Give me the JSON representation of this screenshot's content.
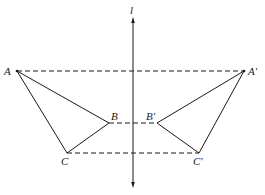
{
  "diagram": {
    "axis_label": "l",
    "points": [
      {
        "id": "A",
        "label": "A"
      },
      {
        "id": "B",
        "label": "B"
      },
      {
        "id": "C",
        "label": "C"
      },
      {
        "id": "A1",
        "label": "A′"
      },
      {
        "id": "B1",
        "label": "B′"
      },
      {
        "id": "C1",
        "label": "C′"
      }
    ],
    "triangles": [
      {
        "name": "original",
        "vertices": [
          "A",
          "B",
          "C"
        ]
      },
      {
        "name": "image",
        "vertices": [
          "A1",
          "B1",
          "C1"
        ]
      }
    ],
    "correspondence_segments": [
      {
        "from": "A",
        "to": "A1",
        "style": "dashed"
      },
      {
        "from": "B",
        "to": "B1",
        "style": "dashed"
      },
      {
        "from": "C",
        "to": "C1",
        "style": "dashed"
      }
    ]
  }
}
